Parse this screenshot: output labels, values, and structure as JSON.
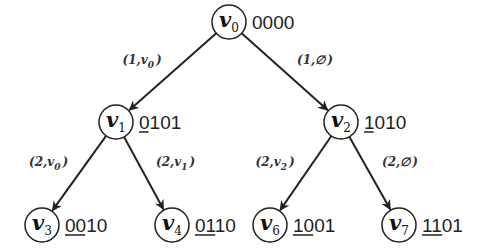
{
  "diagram": {
    "type": "binary-tree",
    "nodes": [
      {
        "id": "v0",
        "name": "v",
        "sub": "0",
        "code": "0000",
        "underline_count": 0,
        "x": 229,
        "y": 22
      },
      {
        "id": "v1",
        "name": "v",
        "sub": "1",
        "code": "0101",
        "underline_count": 1,
        "x": 116,
        "y": 122
      },
      {
        "id": "v2",
        "name": "v",
        "sub": "2",
        "code": "1010",
        "underline_count": 1,
        "x": 341,
        "y": 122
      },
      {
        "id": "v3",
        "name": "v",
        "sub": "3",
        "code": "0010",
        "underline_count": 2,
        "x": 42,
        "y": 225
      },
      {
        "id": "v4",
        "name": "v",
        "sub": "4",
        "code": "0110",
        "underline_count": 2,
        "x": 172,
        "y": 225
      },
      {
        "id": "v6",
        "name": "v",
        "sub": "6",
        "code": "1001",
        "underline_count": 2,
        "x": 270,
        "y": 225
      },
      {
        "id": "v7",
        "name": "v",
        "sub": "7",
        "code": "1101",
        "underline_count": 2,
        "x": 399,
        "y": 225
      }
    ],
    "edges": [
      {
        "from": "v0",
        "to": "v1",
        "label_pre": "(1,",
        "label_var": "v",
        "label_sub": "0",
        "label_post": ")"
      },
      {
        "from": "v0",
        "to": "v2",
        "label_pre": "(1,",
        "label_var": "∅",
        "label_sub": "",
        "label_post": ")"
      },
      {
        "from": "v1",
        "to": "v3",
        "label_pre": "(2,",
        "label_var": "v",
        "label_sub": "0",
        "label_post": ")"
      },
      {
        "from": "v1",
        "to": "v4",
        "label_pre": "(2,",
        "label_var": "v",
        "label_sub": "1",
        "label_post": ")"
      },
      {
        "from": "v2",
        "to": "v6",
        "label_pre": "(2,",
        "label_var": "v",
        "label_sub": "2",
        "label_post": ")"
      },
      {
        "from": "v2",
        "to": "v7",
        "label_pre": "(2,",
        "label_var": "∅",
        "label_sub": "",
        "label_post": ")"
      }
    ],
    "colors": {
      "stroke": "#222222",
      "text": "#111111"
    }
  }
}
